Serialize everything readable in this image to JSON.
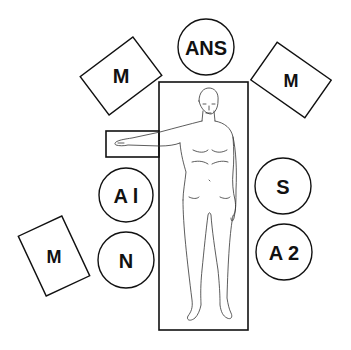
{
  "diagram": {
    "title": "",
    "colors": {
      "stroke": "#111111",
      "background": "#ffffff",
      "figure": "#333333"
    },
    "table": {
      "label": ""
    },
    "arm_board": {
      "label": ""
    },
    "stations": [
      {
        "id": "ans",
        "shape": "circle",
        "label": "ANS"
      },
      {
        "id": "m_top_left",
        "shape": "rectangle",
        "label": "M"
      },
      {
        "id": "m_top_right",
        "shape": "rectangle",
        "label": "M"
      },
      {
        "id": "a1",
        "shape": "circle",
        "label": "A l"
      },
      {
        "id": "n",
        "shape": "circle",
        "label": "N"
      },
      {
        "id": "m_bottom_left",
        "shape": "rectangle",
        "label": "M"
      },
      {
        "id": "s",
        "shape": "circle",
        "label": "S"
      },
      {
        "id": "a2",
        "shape": "circle",
        "label": "A 2"
      }
    ]
  }
}
